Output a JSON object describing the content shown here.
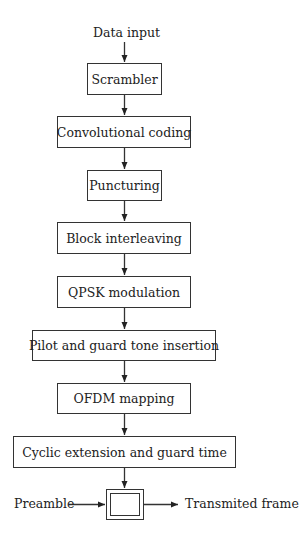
{
  "diagram": {
    "type": "block-flowchart",
    "input_label": "Data input",
    "blocks": [
      {
        "id": "scrambler",
        "label": "Scrambler"
      },
      {
        "id": "convolutional-coding",
        "label": "Convolutional coding"
      },
      {
        "id": "puncturing",
        "label": "Puncturing"
      },
      {
        "id": "block-interleaving",
        "label": "Block interleaving"
      },
      {
        "id": "qpsk-modulation",
        "label": "QPSK modulation"
      },
      {
        "id": "pilot-guard-tone-insertion",
        "label": "Pilot and guard tone insertion"
      },
      {
        "id": "ofdm-mapping",
        "label": "OFDM mapping"
      },
      {
        "id": "cyclic-extension-guard-time",
        "label": "Cyclic extension and guard time"
      }
    ],
    "combiner": {
      "left_input_label": "Preamble",
      "output_label": "Transmited frame"
    },
    "colors": {
      "line": "#333333",
      "background": "#ffffff"
    }
  }
}
